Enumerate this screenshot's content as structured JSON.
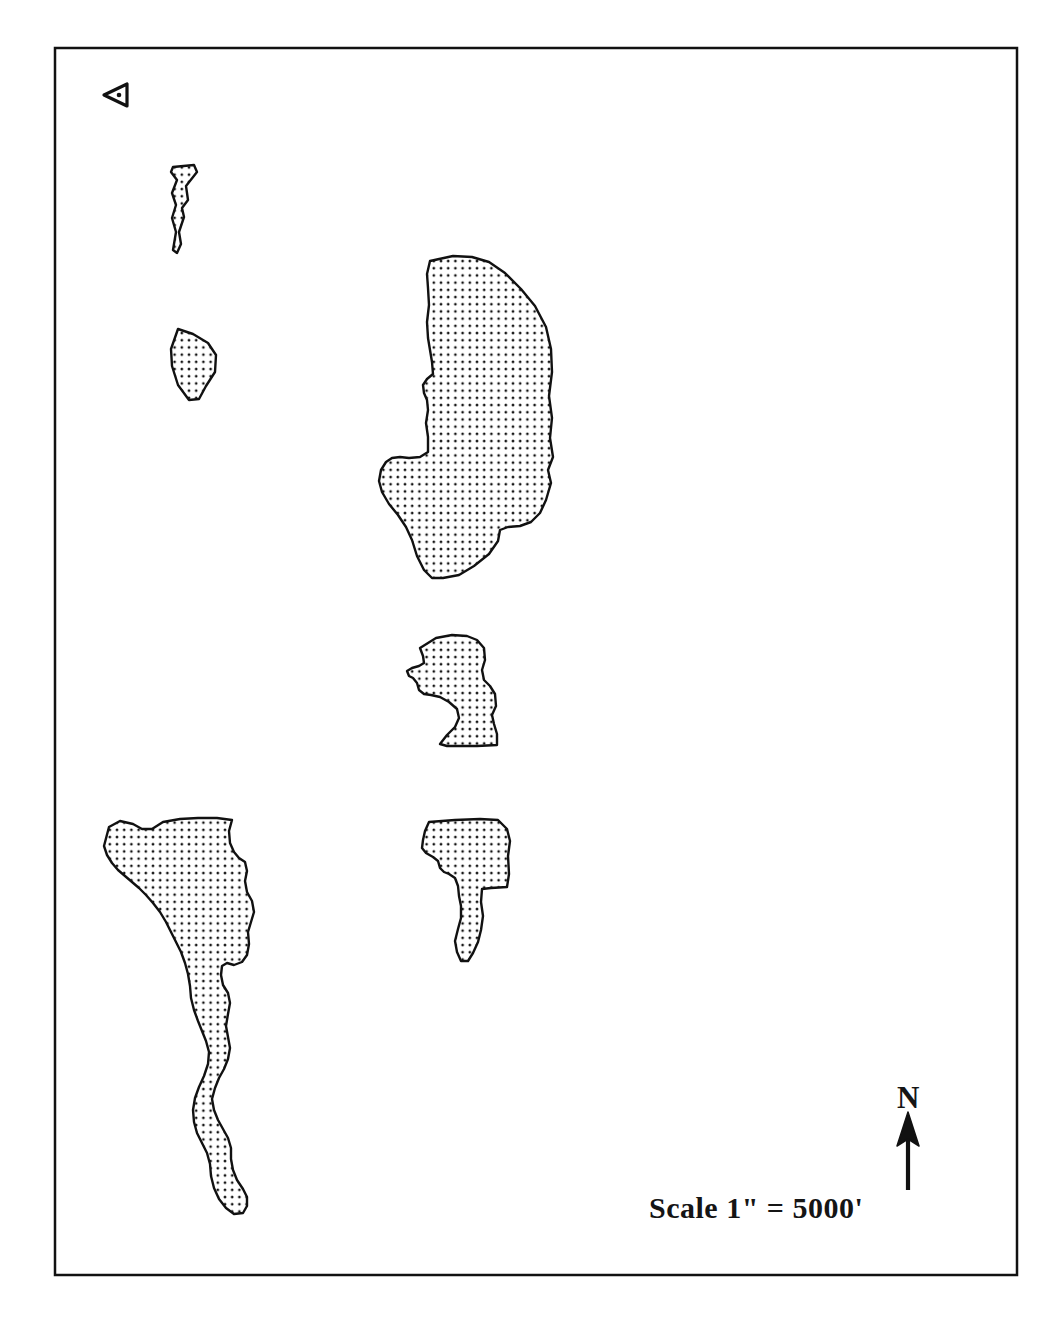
{
  "map": {
    "title": "",
    "background_color": "#ffffff",
    "frame": {
      "stroke_color": "#111111",
      "stroke_width": 2.5,
      "x": 55,
      "y": 48,
      "width": 962,
      "height": 1227
    },
    "fill_pattern": {
      "name": "stipple-dots",
      "dot_color": "#111111",
      "background_color": "#ffffff",
      "spacing_px": 7.2,
      "dot_radius_px": 1.35
    },
    "polygon_stroke_color": "#111111",
    "polygon_stroke_width": 2.4,
    "scale_bar": {
      "label": "Scale 1\" = 5000'"
    },
    "north_arrow": {
      "label": "N",
      "icon": "north-arrow-icon",
      "shaft_color": "#111111"
    },
    "benchmark_marker": {
      "icon": "triangle-left-marker-icon",
      "direction": "left",
      "stroke_color": "#111111"
    },
    "polygons": [
      {
        "id": "parcel-sliver-north",
        "name": "Narrow sliver parcel (upper left)",
        "points": "173,167 194,165 197,172 186,186 188,200 182,208 184,217 179,232 181,244 177,253 173,250 176,232 172,218 176,205 172,193 177,180 171,172"
      },
      {
        "id": "parcel-small-west",
        "name": "Small parcel (west, mid-upper)",
        "points": "178,329 193,334 208,343 216,355 215,372 206,386 199,399 189,400 178,385 172,366 171,349"
      },
      {
        "id": "parcel-main-central",
        "name": "Large central parcel",
        "points": "430,261 453,256 472,257 489,262 505,273 521,289 535,306 546,327 551,349 552,372 549,396 552,418 550,438 553,457 548,470 551,483 546,500 540,513 531,522 520,526 508,527 500,530 498,541 489,554 474,566 459,575 443,578 432,578 424,570 417,556 412,540 406,527 398,515 389,504 382,492 379,481 381,470 386,462 392,458 400,457 409,458 420,457 428,452 428,437 426,423 428,410 427,400 424,393 423,385 427,379 433,374 432,362 430,350 428,338 427,322 429,305 428,288 427,274"
      },
      {
        "id": "parcel-central-small",
        "name": "Small parcel (central, below main)",
        "points": "420,648 436,638 452,635 467,636 477,640 484,648 485,660 482,670 484,680 490,686 495,694 496,706 492,715 494,724 497,734 497,745 477,746 460,746 447,746 440,744 447,735 455,727 459,718 457,709 449,702 440,697 431,695 424,694 419,690 417,683 413,678 409,676 407,671 412,668 419,666 424,663 423,656"
      },
      {
        "id": "parcel-l-shape",
        "name": "L-shaped parcel (lower central)",
        "points": "429,822 455,820 480,819 498,820 507,829 510,841 508,856 509,874 507,887 491,888 482,889 481,902 483,916 481,930 478,942 473,953 468,961 461,961 457,952 455,941 458,929 461,918 461,906 459,896 458,886 455,878 449,874 444,872 440,868 438,861 433,857 426,853 422,848 423,840 425,831"
      },
      {
        "id": "parcel-southwest-elongated",
        "name": "Elongated parcel (southwest)",
        "points": "109,827 120,821 133,824 142,829 152,829 163,822 180,819 198,818 217,818 232,820 229,831 230,843 234,852 239,858 245,862 247,871 245,881 247,892 252,901 254,912 251,922 248,932 249,944 247,955 242,962 234,965 227,963 222,966 221,975 223,985 228,993 230,1003 228,1014 226,1026 228,1037 230,1048 228,1059 224,1069 219,1078 215,1088 212,1099 214,1110 218,1120 223,1129 228,1138 231,1148 231,1159 233,1170 237,1180 243,1189 247,1197 247,1206 243,1213 234,1214 226,1208 219,1199 214,1188 211,1176 210,1164 207,1153 202,1143 197,1133 194,1122 193,1110 195,1098 199,1087 204,1076 208,1064 209,1052 206,1041 202,1031 198,1021 194,1010 191,998 190,986 188,974 185,963 181,952 176,942 171,932 166,922 160,912 153,903 146,895 139,888 132,882 125,876 118,870 112,863 107,855 104,846"
      }
    ]
  }
}
